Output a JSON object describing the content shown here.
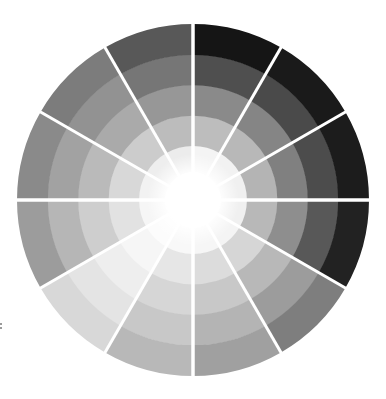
{
  "wheel": {
    "title": "Grayscale value wheel",
    "center": [
      193,
      200
    ],
    "outer_radius": 176,
    "hub_radius": 24,
    "ring_count": 5,
    "segment_count": 12,
    "divider_color": "#ffffff",
    "hub_color": "#ffffff",
    "segments": [
      {
        "start_deg": 0,
        "rings": [
          "#f4f4f4",
          "#bdbdbd",
          "#8a8a8a",
          "#4f4f4f",
          "#151515"
        ]
      },
      {
        "start_deg": 30,
        "rings": [
          "#f2f2f2",
          "#b8b8b8",
          "#858585",
          "#4a4a4a",
          "#1a1a1a"
        ]
      },
      {
        "start_deg": 60,
        "rings": [
          "#f0f0f0",
          "#b4b4b4",
          "#808080",
          "#4c4c4c",
          "#1c1c1c"
        ]
      },
      {
        "start_deg": 90,
        "rings": [
          "#f0f0f0",
          "#b8b8b8",
          "#8e8e8e",
          "#585858",
          "#222222"
        ]
      },
      {
        "start_deg": 120,
        "rings": [
          "#f4f4f4",
          "#d6d6d6",
          "#b8b8b8",
          "#9c9c9c",
          "#7e7e7e"
        ]
      },
      {
        "start_deg": 150,
        "rings": [
          "#f6f6f6",
          "#dcdcdc",
          "#c8c8c8",
          "#b4b4b4",
          "#a0a0a0"
        ]
      },
      {
        "start_deg": 180,
        "rings": [
          "#f8f8f8",
          "#e6e6e6",
          "#d6d6d6",
          "#c8c8c8",
          "#b8b8b8"
        ]
      },
      {
        "start_deg": 210,
        "rings": [
          "#fcfcfc",
          "#f6f6f6",
          "#eeeeee",
          "#e4e4e4",
          "#d8d8d8"
        ]
      },
      {
        "start_deg": 240,
        "rings": [
          "#f6f6f6",
          "#e2e2e2",
          "#cecece",
          "#b6b6b6",
          "#9c9c9c"
        ]
      },
      {
        "start_deg": 270,
        "rings": [
          "#f2f2f2",
          "#d8d8d8",
          "#bababa",
          "#a2a2a2",
          "#8a8a8a"
        ]
      },
      {
        "start_deg": 300,
        "rings": [
          "#eeeeee",
          "#cccccc",
          "#aaaaaa",
          "#929292",
          "#7c7c7c"
        ]
      },
      {
        "start_deg": 330,
        "rings": [
          "#ececec",
          "#bcbcbc",
          "#979797",
          "#767676",
          "#585858"
        ]
      }
    ]
  }
}
